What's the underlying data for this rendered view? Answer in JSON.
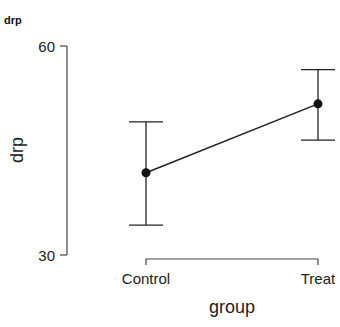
{
  "panel_label": "drp",
  "chart_data": {
    "type": "line",
    "title": "",
    "xlabel": "group",
    "ylabel": "drp",
    "categories": [
      "Control",
      "Treat"
    ],
    "series": [
      {
        "name": "drp",
        "values": [
          41.8,
          51.7
        ],
        "error_lower": [
          34.3,
          46.5
        ],
        "error_upper": [
          49.1,
          56.6
        ]
      }
    ],
    "ylim": [
      30,
      60
    ],
    "yticks": [
      30,
      60
    ],
    "grid": false,
    "legend": "none",
    "colors": {
      "line": "#222222",
      "point": "#111111",
      "axis": "#444444"
    }
  }
}
